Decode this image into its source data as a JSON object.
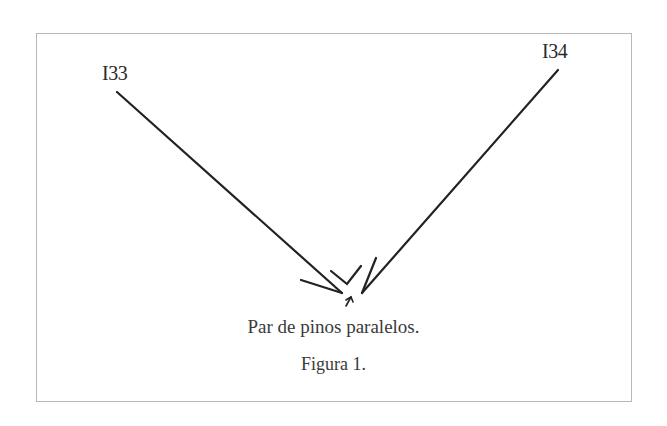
{
  "diagram": {
    "labels": [
      {
        "id": "pin-133",
        "text": "I33"
      },
      {
        "id": "pin-134",
        "text": "I34"
      }
    ],
    "caption": "Par de pinos paralelos.",
    "figure_label": "Figura 1.",
    "colors": {
      "stroke": "#222222",
      "border": "#b8b8b8",
      "text": "#3a3a3a"
    }
  }
}
